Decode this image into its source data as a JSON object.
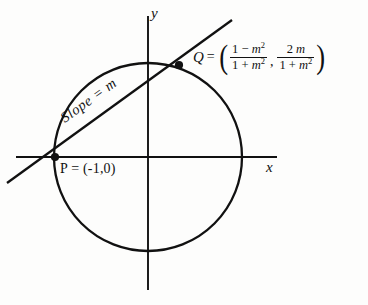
{
  "figure": {
    "background_color": "#fdfdfc",
    "stroke_color": "#111111",
    "width": 368,
    "height": 305
  },
  "axes": {
    "x_label": "x",
    "y_label": "y",
    "origin": {
      "x": 148,
      "y": 157
    },
    "x_axis": {
      "from_x": 16,
      "to_x": 277,
      "y": 157
    },
    "y_axis": {
      "x": 148,
      "from_y": 16,
      "to_y": 290
    }
  },
  "circle": {
    "name": "unit-circle",
    "center_x": 148,
    "center_y": 157,
    "radius": 94
  },
  "line": {
    "name": "secant-line",
    "slope_label": "Slope = m",
    "from": {
      "x": 7,
      "y": 183
    },
    "to": {
      "x": 232,
      "y": 20
    }
  },
  "points": [
    {
      "id": "P",
      "label": "P = (-1,0)",
      "x": 55,
      "y": 157
    },
    {
      "id": "Q",
      "label": "Q",
      "x": 179,
      "y": 65
    }
  ],
  "q_expression": {
    "name": "Q",
    "equals": "=",
    "open_paren": "(",
    "close_paren": ")",
    "comma": ",",
    "x_coord": {
      "numerator_pre": "1 − ",
      "numerator_var": "m",
      "numerator_exp": "2",
      "denominator_pre": "1 + ",
      "denominator_var": "m",
      "denominator_exp": "2"
    },
    "y_coord": {
      "numerator_pre": "2 ",
      "numerator_var": "m",
      "numerator_exp": "",
      "denominator_pre": "1 + ",
      "denominator_var": "m",
      "denominator_exp": "2"
    },
    "plain_text": "Q = ((1 - m^2)/(1 + m^2) , 2m/(1 + m^2))"
  }
}
